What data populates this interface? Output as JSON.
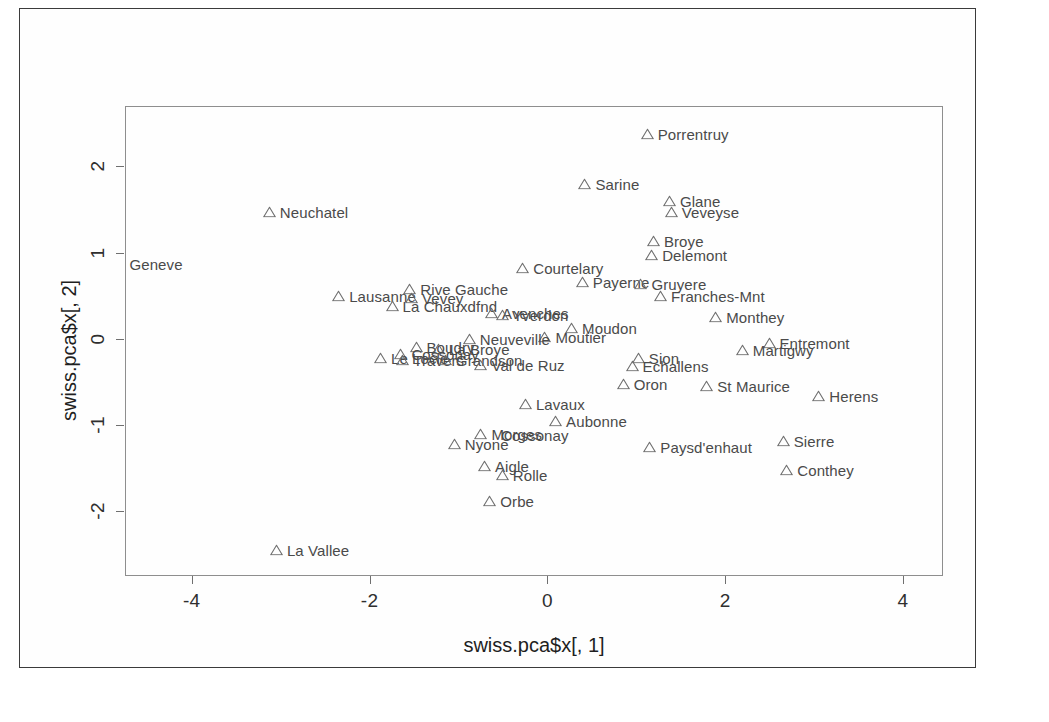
{
  "figure": {
    "type": "r-base-scatterplot",
    "frame_color": "#3b3b3b",
    "box_color": "#8e8e8e",
    "marker_color": "#6f6f6f",
    "label_color": "#4a4a4a",
    "background": "#ffffff"
  },
  "chart_data": {
    "type": "scatter",
    "title": "",
    "subtitle": "",
    "xlabel": "swiss.pca$x[, 1]",
    "ylabel": "swiss.pca$x[, 2]",
    "xlim": [
      -4.75,
      4.45
    ],
    "ylim": [
      -2.75,
      2.7
    ],
    "xticks": [
      "-4",
      "-2",
      "0",
      "2",
      "4"
    ],
    "xtick_values": [
      -4,
      -2,
      0,
      2,
      4
    ],
    "yticks": [
      "-2",
      "-1",
      "0",
      "1",
      "2"
    ],
    "ytick_values": [
      -2,
      -1,
      0,
      1,
      2
    ],
    "grid": false,
    "legend": "none",
    "marker_shape": "triangle-up",
    "label_position": "right-of-marker",
    "points": [
      {
        "label": "Porrentruy",
        "x": 1.05,
        "y": 2.38
      },
      {
        "label": "Sarine",
        "x": 0.35,
        "y": 1.8
      },
      {
        "label": "Glane",
        "x": 1.3,
        "y": 1.6
      },
      {
        "label": "Veveyse",
        "x": 1.32,
        "y": 1.47
      },
      {
        "label": "Neuchatel",
        "x": -3.2,
        "y": 1.47
      },
      {
        "label": "Broye",
        "x": 1.12,
        "y": 1.13
      },
      {
        "label": "Delemont",
        "x": 1.1,
        "y": 0.97
      },
      {
        "label": "Geneve",
        "x": -4.7,
        "y": 0.87,
        "marker": false
      },
      {
        "label": "Courtelary",
        "x": -0.35,
        "y": 0.82
      },
      {
        "label": "Payerne",
        "x": 0.32,
        "y": 0.66
      },
      {
        "label": "Gruyere",
        "x": 0.98,
        "y": 0.64
      },
      {
        "label": "Rive Gauche",
        "x": -1.62,
        "y": 0.58
      },
      {
        "label": "Lausanne",
        "x": -2.42,
        "y": 0.5
      },
      {
        "label": "Franches-Mnt",
        "x": 1.2,
        "y": 0.5
      },
      {
        "label": "Vevey",
        "x": -1.6,
        "y": 0.47
      },
      {
        "label": "La Chauxdfnd",
        "x": -1.82,
        "y": 0.38
      },
      {
        "label": "Avenches",
        "x": -0.7,
        "y": 0.3
      },
      {
        "label": "Yverdon",
        "x": -0.58,
        "y": 0.28
      },
      {
        "label": "Monthey",
        "x": 1.82,
        "y": 0.25
      },
      {
        "label": "Moudon",
        "x": 0.2,
        "y": 0.12
      },
      {
        "label": "Moutier",
        "x": -0.1,
        "y": 0.02
      },
      {
        "label": "Neuveville",
        "x": -0.95,
        "y": 0.0
      },
      {
        "label": "Entremont",
        "x": 2.42,
        "y": -0.05
      },
      {
        "label": "Boudry",
        "x": -1.55,
        "y": -0.1
      },
      {
        "label": "La Broye",
        "x": -1.3,
        "y": -0.12
      },
      {
        "label": "Martigwy",
        "x": 2.12,
        "y": -0.13
      },
      {
        "label": "Cossonay",
        "x": -1.72,
        "y": -0.18
      },
      {
        "label": "Le Locle",
        "x": -1.95,
        "y": -0.22
      },
      {
        "label": "Travers",
        "x": -1.7,
        "y": -0.24
      },
      {
        "label": "Grandson",
        "x": -1.22,
        "y": -0.25
      },
      {
        "label": "Val de Ruz",
        "x": -0.82,
        "y": -0.3
      },
      {
        "label": "Sion",
        "x": 0.95,
        "y": -0.22
      },
      {
        "label": "Echallens",
        "x": 0.88,
        "y": -0.32
      },
      {
        "label": "Oron",
        "x": 0.78,
        "y": -0.52
      },
      {
        "label": "St Maurice",
        "x": 1.72,
        "y": -0.55
      },
      {
        "label": "Herens",
        "x": 2.98,
        "y": -0.66
      },
      {
        "label": "Lavaux",
        "x": -0.32,
        "y": -0.75
      },
      {
        "label": "Aubonne",
        "x": 0.02,
        "y": -0.95
      },
      {
        "label": "Morges",
        "x": -0.82,
        "y": -1.1
      },
      {
        "label": "Cossonay2",
        "x": -0.52,
        "y": -1.12,
        "display": "Cossonay",
        "marker": false
      },
      {
        "label": "Sierre",
        "x": 2.58,
        "y": -1.18
      },
      {
        "label": "Nyone",
        "x": -1.12,
        "y": -1.22
      },
      {
        "label": "Paysd'enhaut",
        "x": 1.08,
        "y": -1.25
      },
      {
        "label": "Aigle",
        "x": -0.78,
        "y": -1.48
      },
      {
        "label": "Conthey",
        "x": 2.62,
        "y": -1.52
      },
      {
        "label": "Rolle",
        "x": -0.58,
        "y": -1.58
      },
      {
        "label": "Orbe",
        "x": -0.72,
        "y": -1.88
      },
      {
        "label": "La Vallee",
        "x": -3.12,
        "y": -2.45
      }
    ]
  }
}
